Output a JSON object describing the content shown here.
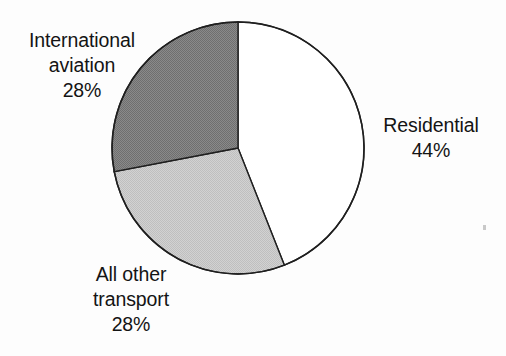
{
  "figure": {
    "background_color": "#fdfdfd",
    "outline_color": "#1a1a1a"
  },
  "chart_data": {
    "type": "pie",
    "title": "",
    "subtitle": "",
    "xlabel": "",
    "ylabel": "",
    "legend_position": "none",
    "grid": false,
    "units": "percent",
    "total": 100,
    "start_angle_deg": 0,
    "direction": "clockwise",
    "center": {
      "x": 238,
      "y": 148
    },
    "radius": 126,
    "categories": [
      "Residential",
      "All other transport",
      "International aviation"
    ],
    "values": [
      44,
      28,
      28
    ],
    "value_labels": [
      "44%",
      "28%",
      "28%"
    ],
    "slices": [
      {
        "name": "Residential",
        "value": 44,
        "value_label": "44%",
        "fill": "#ffffff",
        "fill_name": "white",
        "start_deg": 0,
        "end_deg": 158.4,
        "label_position": "right"
      },
      {
        "name": "All other transport",
        "value": 28,
        "value_label": "28%",
        "fill": "#c8c8c8",
        "fill_name": "light-gray",
        "start_deg": 158.4,
        "end_deg": 259.2,
        "label_position": "bottom-left"
      },
      {
        "name": "International aviation",
        "value": 28,
        "value_label": "28%",
        "fill": "#808080",
        "fill_name": "dark-gray",
        "start_deg": 259.2,
        "end_deg": 360,
        "label_position": "top-left"
      }
    ]
  },
  "labels": {
    "international": {
      "line1": "International",
      "line2": "aviation",
      "value": "28%"
    },
    "residential": {
      "line1": "Residential",
      "value": "44%"
    },
    "transport": {
      "line1": "All other",
      "line2": "transport",
      "value": "28%"
    }
  }
}
